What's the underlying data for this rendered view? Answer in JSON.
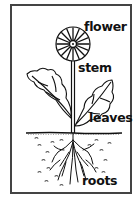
{
  "diagram": {
    "labels": {
      "flower": "flower",
      "stem": "stem",
      "leaves": "leaves",
      "roots": "roots"
    },
    "colors": {
      "ink": "#111111",
      "border": "#444444",
      "background": "#ffffff"
    }
  }
}
